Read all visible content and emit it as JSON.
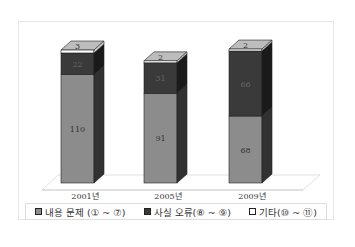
{
  "chart_data": {
    "type": "bar",
    "stacked": true,
    "three_d": true,
    "categories": [
      "2001년",
      "2005년",
      "2009년"
    ],
    "series": [
      {
        "name": "내용 문제 (① ~ ⑦)",
        "values": [
          110,
          91,
          68
        ],
        "color": "#8c8c8c"
      },
      {
        "name": "사실 오류(⑧ ~ ⑨)",
        "values": [
          22,
          31,
          66
        ],
        "color": "#3a3a3a"
      },
      {
        "name": "기타(⑩ ~ ⑪)",
        "values": [
          3,
          2,
          2
        ],
        "color": "#ffffff"
      }
    ],
    "title": "",
    "xlabel": "",
    "ylabel": "",
    "grid": false,
    "legend_position": "bottom"
  },
  "legend": {
    "items": [
      {
        "label": "내용 문제 (① ~ ⑦)",
        "color": "#8c8c8c"
      },
      {
        "label": "사실 오류(⑧ ~ ⑨)",
        "color": "#3a3a3a"
      },
      {
        "label": "기타(⑩ ~ ⑪)",
        "color": "#ffffff"
      }
    ]
  },
  "bars": [
    {
      "category": "2001년",
      "labels": {
        "s0": "110",
        "s1": "22",
        "s2": "3"
      }
    },
    {
      "category": "2005년",
      "labels": {
        "s0": "91",
        "s1": "31",
        "s2": "2"
      }
    },
    {
      "category": "2009년",
      "labels": {
        "s0": "68",
        "s1": "66",
        "s2": "2"
      }
    }
  ]
}
